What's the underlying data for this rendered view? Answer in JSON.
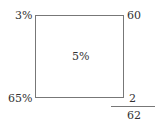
{
  "diagram": {
    "type": "alligation-mixture",
    "top_left": "3%",
    "top_right": "60",
    "center": "5%",
    "bottom_left": "65%",
    "bottom_right": "2",
    "total": "62"
  },
  "colors": {
    "line": "#777777",
    "text": "#333333"
  }
}
